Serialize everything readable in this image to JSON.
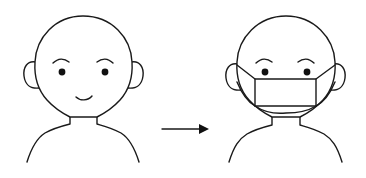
{
  "diagram": {
    "type": "instructional-illustration",
    "description": "Person without a face mask, arrow, same person wearing a face mask",
    "panels": [
      {
        "id": "before",
        "label": "face without mask",
        "features": [
          "head",
          "ears",
          "eyebrows",
          "eyes",
          "smile",
          "neck",
          "shoulders"
        ]
      },
      {
        "id": "after",
        "label": "face with mask",
        "features": [
          "head",
          "ears",
          "eyebrows",
          "eyes",
          "face-mask",
          "mask-ear-loops",
          "neck",
          "shoulders"
        ]
      }
    ],
    "connector": {
      "type": "arrow",
      "direction": "right"
    }
  },
  "colors": {
    "line": "#1a1a1a",
    "background": "#ffffff",
    "eye": "#111111"
  }
}
